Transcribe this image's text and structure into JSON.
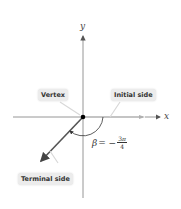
{
  "diagram": {
    "axes": {
      "x_label": "x",
      "y_label": "y"
    },
    "labels": {
      "vertex": "Vertex",
      "initial_side": "Initial side",
      "terminal_side": "Terminal side"
    },
    "angle": {
      "symbol": "β",
      "equals": "= −",
      "numerator_coef": "3",
      "numerator_sym": "π",
      "denominator": "4",
      "value_text": "β = −3π/4"
    },
    "colors": {
      "axis": "#8a8a8a",
      "terminal_side": "#555555",
      "initial_side": "#b0b0b0",
      "vertex": "#000000",
      "label_bg": "#ececec"
    }
  }
}
